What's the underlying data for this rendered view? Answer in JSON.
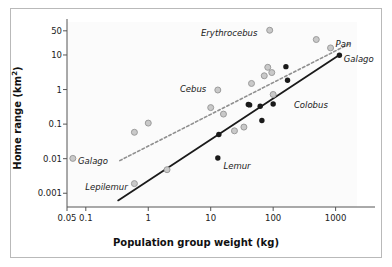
{
  "figure": {
    "background": "#ffffff",
    "frame_color": "#b9b9b9",
    "plot_background": "#fbfbfb"
  },
  "chart_data": {
    "type": "scatter",
    "title": "",
    "xlabel": "Population group weight (kg)",
    "ylabel": "Home range (km²)",
    "xscale": "log",
    "yscale": "log",
    "xlim": [
      0.05,
      2200
    ],
    "ylim": [
      0.0004,
      90
    ],
    "grid": false,
    "legend": "none",
    "xticks": [
      {
        "value": 0.05,
        "label": "0.05"
      },
      {
        "value": 0.1,
        "label": "0.1"
      },
      {
        "value": 1,
        "label": "1"
      },
      {
        "value": 10,
        "label": "10"
      },
      {
        "value": 100,
        "label": "100"
      },
      {
        "value": 1000,
        "label": "1000"
      }
    ],
    "yticks": [
      {
        "value": 0.001,
        "label": "0.001"
      },
      {
        "value": 0.01,
        "label": "0.01"
      },
      {
        "value": 0.1,
        "label": "0.1"
      },
      {
        "value": 1,
        "label": "1"
      },
      {
        "value": 10,
        "label": "10"
      },
      {
        "value": 50,
        "label": "50"
      }
    ],
    "series": [
      {
        "name": "gray-group",
        "marker": "circle-open",
        "color": "#9b9b9b",
        "fill": "#c9c9c9",
        "points": [
          {
            "x": 0.062,
            "y": 0.0102
          },
          {
            "x": 0.6,
            "y": 0.0019
          },
          {
            "x": 0.6,
            "y": 0.058
          },
          {
            "x": 1.0,
            "y": 0.107
          },
          {
            "x": 2.0,
            "y": 0.0048
          },
          {
            "x": 10.0,
            "y": 0.3
          },
          {
            "x": 13.0,
            "y": 0.97
          },
          {
            "x": 16.0,
            "y": 0.195
          },
          {
            "x": 24.0,
            "y": 0.064
          },
          {
            "x": 34.0,
            "y": 0.082
          },
          {
            "x": 45.0,
            "y": 1.5
          },
          {
            "x": 72.0,
            "y": 2.5
          },
          {
            "x": 82.0,
            "y": 4.4
          },
          {
            "x": 88.0,
            "y": 52.0
          },
          {
            "x": 95.0,
            "y": 3.1
          },
          {
            "x": 100.0,
            "y": 0.72
          },
          {
            "x": 490.0,
            "y": 28.0
          },
          {
            "x": 830.0,
            "y": 16.0
          }
        ]
      },
      {
        "name": "black-group",
        "marker": "circle-filled",
        "color": "#1a1a1a",
        "fill": "#1a1a1a",
        "points": [
          {
            "x": 13.5,
            "y": 0.05
          },
          {
            "x": 13.0,
            "y": 0.0105
          },
          {
            "x": 40.0,
            "y": 0.37
          },
          {
            "x": 42.0,
            "y": 0.36
          },
          {
            "x": 62.0,
            "y": 0.33
          },
          {
            "x": 66.0,
            "y": 0.127
          },
          {
            "x": 100.0,
            "y": 0.38
          },
          {
            "x": 160.0,
            "y": 4.6
          },
          {
            "x": 170.0,
            "y": 1.85
          },
          {
            "x": 1150.0,
            "y": 9.8
          }
        ]
      }
    ],
    "trend_lines": [
      {
        "name": "gray-trend",
        "style": "dashed",
        "color": "#8f8f8f",
        "x_start": 0.35,
        "y_start": 0.0088,
        "x_end": 1750.0,
        "y_end": 22.0
      },
      {
        "name": "black-trend",
        "style": "solid",
        "color": "#1a1a1a",
        "x_start": 0.33,
        "y_start": 0.00062,
        "x_end": 1160.0,
        "y_end": 10.2
      }
    ],
    "annotations": [
      {
        "text": "Erythrocebus",
        "x": 56.0,
        "y": 40.0,
        "anchor": "end"
      },
      {
        "text": "Pan",
        "x": 1000.0,
        "y": 20.0,
        "anchor": "start"
      },
      {
        "text": "Galago",
        "x": 1350.0,
        "y": 7.0,
        "anchor": "start"
      },
      {
        "text": "Cebus",
        "x": 8.5,
        "y": 0.95,
        "anchor": "end"
      },
      {
        "text": "Colobus",
        "x": 215.0,
        "y": 0.33,
        "anchor": "start"
      },
      {
        "text": "Lemur",
        "x": 16.0,
        "y": 0.0058,
        "anchor": "start"
      },
      {
        "text": "Lepilemur",
        "x": 0.47,
        "y": 0.00145,
        "anchor": "end"
      },
      {
        "text": "Galago",
        "x": 0.075,
        "y": 0.0082,
        "anchor": "start"
      }
    ]
  }
}
